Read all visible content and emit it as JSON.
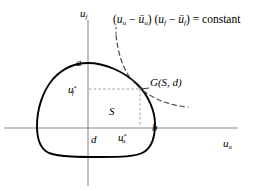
{
  "figure": {
    "type": "math-diagram",
    "background_color": "#ffffff",
    "axis_color": "#808080",
    "curve_color": "#000000",
    "dashed_curve_color": "#555555",
    "guide_color": "#9a9a9a",
    "axes": {
      "y_axis_label": "u",
      "y_axis_label_sub": "f",
      "x_axis_label": "u",
      "x_axis_label_sub": "u",
      "origin": {
        "x": 88,
        "y": 128
      }
    },
    "formula": {
      "open_paren_1": "(",
      "u_1": "u",
      "u_1_sub": "u",
      "minus_1": " − ",
      "ubar_1": "ū",
      "ubar_1_sub": "u",
      "close_paren_1": ")",
      "space": " ",
      "open_paren_2": "(",
      "u_2": "u",
      "u_2_sub": "f",
      "minus_2": " − ",
      "ubar_2": "ū",
      "ubar_2_sub": "f",
      "close_paren_2": ")",
      "equals": " = ",
      "rhs": "constant"
    },
    "labels": {
      "point_a": "a",
      "point_b": "b",
      "point_d": "d",
      "region_S": "S",
      "solution_u_star_u_base": "u",
      "solution_u_star_u_sup": "*",
      "solution_u_star_u_sub": "u",
      "solution_u_star_f_base": "u",
      "solution_u_star_f_sup": "*",
      "solution_u_star_f_sub": "f",
      "nash_point": "G(S, d)"
    },
    "geometry": {
      "bargaining_set_boundary": "closed convex oval",
      "hyperbola": "dashed level curve of the Nash product, tangent at G(S, d)",
      "guides": "dashed horizontal line at u*_f and dashed vertical line at u*_u meeting at G(S, d)"
    }
  }
}
